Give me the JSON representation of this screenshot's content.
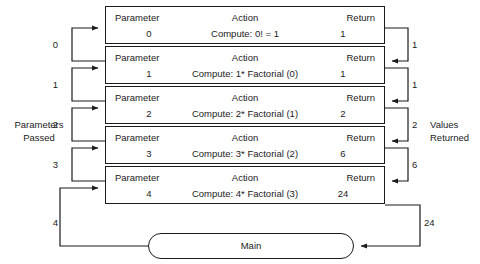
{
  "diagram": {
    "left_label": {
      "line1": "Parameters",
      "line2": "Passed"
    },
    "right_label": {
      "line1": "Values",
      "line2": "Returned"
    },
    "column_headers": {
      "parameter": "Parameter",
      "action": "Action",
      "return": "Return"
    },
    "frames": [
      {
        "parameter": "0",
        "action": "Compute:  0! = 1",
        "return": "1"
      },
      {
        "parameter": "1",
        "action": "Compute:  1* Factorial (0)",
        "return": "1"
      },
      {
        "parameter": "2",
        "action": "Compute:  2* Factorial (1)",
        "return": "2"
      },
      {
        "parameter": "3",
        "action": "Compute:  3* Factorial (2)",
        "return": "6"
      },
      {
        "parameter": "4",
        "action": "Compute:  4* Factorial (3)",
        "return": "24"
      }
    ],
    "main_box": {
      "label": "Main"
    },
    "parameters_passed": [
      "0",
      "1",
      "2",
      "3",
      "4"
    ],
    "values_returned": [
      "1",
      "1",
      "2",
      "6",
      "24"
    ],
    "colors": {
      "stroke": "#1b1b1b",
      "background": "#ffffff",
      "text": "#1b1b1b"
    }
  }
}
